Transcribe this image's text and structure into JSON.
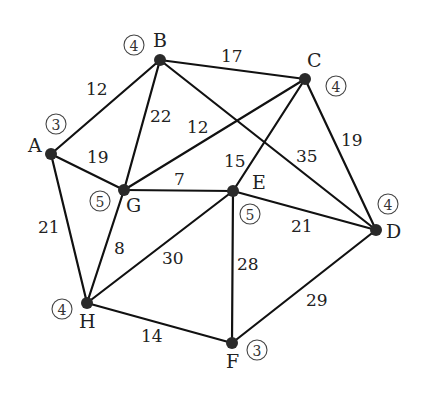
{
  "graph": {
    "nodes": [
      {
        "id": "A",
        "x": 51,
        "y": 154,
        "label": "A",
        "degree": "3",
        "lx": 28,
        "ly": 152,
        "dx": 56,
        "dy": 124
      },
      {
        "id": "B",
        "x": 160,
        "y": 60,
        "label": "B",
        "degree": "4",
        "lx": 153,
        "ly": 47,
        "dx": 134,
        "dy": 45
      },
      {
        "id": "C",
        "x": 305,
        "y": 79,
        "label": "C",
        "degree": "4",
        "lx": 307,
        "ly": 67,
        "dx": 336,
        "dy": 86
      },
      {
        "id": "D",
        "x": 376,
        "y": 230,
        "label": "D",
        "degree": "4",
        "lx": 386,
        "ly": 238,
        "dx": 388,
        "dy": 204
      },
      {
        "id": "E",
        "x": 233,
        "y": 191,
        "label": "E",
        "degree": "5",
        "lx": 252,
        "ly": 189,
        "dx": 250,
        "dy": 214
      },
      {
        "id": "F",
        "x": 232,
        "y": 343,
        "label": "F",
        "degree": "3",
        "lx": 226,
        "ly": 368,
        "dx": 257,
        "dy": 350
      },
      {
        "id": "G",
        "x": 124,
        "y": 190,
        "label": "G",
        "degree": "5",
        "lx": 126,
        "ly": 212,
        "dx": 100,
        "dy": 201
      },
      {
        "id": "H",
        "x": 87,
        "y": 303,
        "label": "H",
        "degree": "4",
        "lx": 79,
        "ly": 328,
        "dx": 62,
        "dy": 309
      }
    ],
    "edges": [
      {
        "from": "A",
        "to": "B",
        "weight": "12",
        "wx": 86,
        "wy": 95
      },
      {
        "from": "A",
        "to": "G",
        "weight": "19",
        "wx": 87,
        "wy": 163
      },
      {
        "from": "A",
        "to": "H",
        "weight": "21",
        "wx": 38,
        "wy": 233
      },
      {
        "from": "B",
        "to": "C",
        "weight": "17",
        "wx": 221,
        "wy": 62
      },
      {
        "from": "B",
        "to": "G",
        "weight": "22",
        "wx": 150,
        "wy": 122
      },
      {
        "from": "B",
        "to": "D",
        "weight": "35",
        "wx": 296,
        "wy": 162
      },
      {
        "from": "C",
        "to": "G",
        "weight": "12",
        "wx": 187,
        "wy": 133
      },
      {
        "from": "C",
        "to": "E",
        "weight": "15",
        "wx": 224,
        "wy": 167
      },
      {
        "from": "C",
        "to": "D",
        "weight": "19",
        "wx": 341,
        "wy": 146
      },
      {
        "from": "G",
        "to": "E",
        "weight": "7",
        "wx": 174,
        "wy": 185
      },
      {
        "from": "G",
        "to": "H",
        "weight": "8",
        "wx": 114,
        "wy": 254
      },
      {
        "from": "E",
        "to": "D",
        "weight": "21",
        "wx": 291,
        "wy": 232
      },
      {
        "from": "E",
        "to": "H",
        "weight": "30",
        "wx": 162,
        "wy": 264
      },
      {
        "from": "E",
        "to": "F",
        "weight": "28",
        "wx": 237,
        "wy": 270
      },
      {
        "from": "D",
        "to": "F",
        "weight": "29",
        "wx": 306,
        "wy": 306
      },
      {
        "from": "H",
        "to": "F",
        "weight": "14",
        "wx": 141,
        "wy": 342
      }
    ]
  }
}
